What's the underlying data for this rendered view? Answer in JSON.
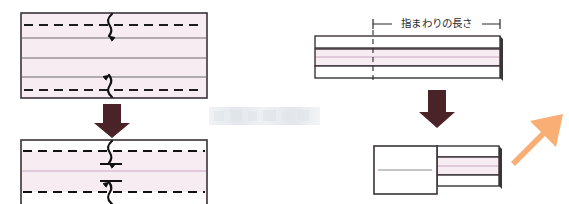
{
  "figure": {
    "title": "指まわりの長さ",
    "kind": "sewing-fold-diagram",
    "canvas": {
      "width": 569,
      "height": 204,
      "background": "#ffffff"
    }
  },
  "labels": {
    "dimension_text": "指まわりの長さ"
  },
  "colors": {
    "fabric_pink": "#f7ecf2",
    "fabric_pink_deep": "#f4e4ee",
    "outline_dark": "#3a3338",
    "outline_gray": "#6a6a6a",
    "fold_line_pink": "#c9a6bd",
    "stitch_black": "#111111",
    "arrow_maroon": "#4a2328",
    "arrow_orange": "#f9ae75",
    "white_panel": "#ffffff",
    "watermark_gray": "#d9dde1"
  },
  "panels": {
    "top_left": {
      "name": "flat-fabric-piece",
      "x": 21,
      "y": 13,
      "width": 186,
      "height": 85,
      "fill": "fabric_pink",
      "dashed_fold_lines_y": [
        25,
        90
      ],
      "solid_guide_lines_y": [
        38,
        58,
        77
      ],
      "stitch_markers": [
        {
          "x": 110,
          "y": 25,
          "direction": "down"
        },
        {
          "x": 110,
          "y": 90,
          "direction": "up"
        }
      ]
    },
    "bottom_left": {
      "name": "folded-fabric-piece",
      "x": 21,
      "y": 140,
      "width": 186,
      "height": 64,
      "fill": "fabric_pink",
      "white_strips": [
        {
          "y": 140,
          "height": 11
        },
        {
          "y": 191,
          "height": 13
        }
      ],
      "dashed_fold_lines_y": [
        151,
        191
      ],
      "center_line_y": 171,
      "stitch_markers": [
        {
          "x": 110,
          "y": 151,
          "direction": "down"
        },
        {
          "x": 110,
          "y": 191,
          "direction": "up"
        }
      ]
    },
    "top_right": {
      "name": "band-strip-piece",
      "x": 315,
      "y": 36,
      "width": 185,
      "height": 42,
      "strips": [
        {
          "kind": "white",
          "y": 36,
          "height": 12
        },
        {
          "kind": "pink",
          "y": 49,
          "height": 17
        },
        {
          "kind": "white",
          "y": 66,
          "height": 12
        }
      ],
      "center_line_y": 57,
      "reference_tick_x": 373,
      "shadow_edge": true
    },
    "bottom_right": {
      "name": "rolled-band-piece",
      "x": 374,
      "y": 146,
      "width": 125,
      "height": 48,
      "left_fold": {
        "x": 374,
        "width": 63,
        "fill": "white_panel",
        "center_line_y": 170
      },
      "right_strips": [
        {
          "kind": "white",
          "height": 11
        },
        {
          "kind": "pink",
          "height": 18
        },
        {
          "kind": "white",
          "height": 11
        }
      ],
      "center_line_y": 170,
      "shadow_edge": true
    }
  },
  "dimension": {
    "name": "finger-circumference-dimension",
    "text": "指まわりの長さ",
    "line_y": 24,
    "left_x": 373,
    "right_x": 500,
    "tick_height": 9,
    "leader_down_to_y": 82
  },
  "arrows": [
    {
      "name": "step-arrow-left",
      "kind": "down",
      "x": 112,
      "y_top": 104,
      "y_bottom": 136,
      "color": "arrow_maroon"
    },
    {
      "name": "step-arrow-right",
      "kind": "down",
      "x": 437,
      "y_top": 90,
      "y_bottom": 140,
      "color": "arrow_maroon"
    },
    {
      "name": "result-arrow",
      "kind": "up-right",
      "x1": 507,
      "y1": 160,
      "x2": 560,
      "y2": 92,
      "color": "arrow_orange"
    }
  ],
  "watermark": {
    "name": "image-watermark",
    "x": 209,
    "y": 107,
    "width": 111,
    "height": 18,
    "visible": true,
    "legible": false,
    "text": ""
  }
}
